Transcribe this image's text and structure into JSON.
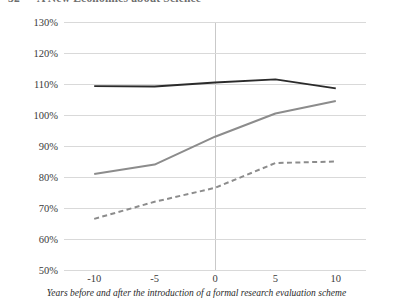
{
  "header": {
    "page_number": "32",
    "running_title": "A New Economics about Science"
  },
  "chart_data": {
    "type": "line",
    "title": "",
    "xlabel": "Years before and after the introduction of a formal research evaluation scheme",
    "ylabel": "",
    "x": [
      -10,
      -5,
      0,
      5,
      10
    ],
    "xtick_labels": [
      "-10",
      "-5",
      "0",
      "5",
      "10"
    ],
    "ytick_labels": [
      "130%",
      "120%",
      "110%",
      "100%",
      "90%",
      "80%",
      "70%",
      "60%",
      "50%"
    ],
    "yticks": [
      130,
      120,
      110,
      100,
      90,
      80,
      70,
      60,
      50
    ],
    "ylim": [
      50,
      130
    ],
    "xlim": [
      -12.5,
      12.5
    ],
    "grid": "horizontal",
    "legend": "none",
    "annotations": [
      "vertical reference line at x = 0"
    ],
    "series": [
      {
        "name": "series-dark-solid",
        "style": "solid",
        "color": "#2b2b2b",
        "width": 1.9,
        "values": [
          109.3,
          109.2,
          110.5,
          111.5,
          108.6
        ]
      },
      {
        "name": "series-grey-solid",
        "style": "solid",
        "color": "#8c8c8c",
        "width": 2.0,
        "values": [
          81.0,
          84.0,
          93.0,
          100.5,
          104.5
        ]
      },
      {
        "name": "series-grey-dashed",
        "style": "dashed",
        "color": "#8c8c8c",
        "width": 2.0,
        "values": [
          66.5,
          72.0,
          76.5,
          84.5,
          85.0
        ]
      }
    ]
  }
}
